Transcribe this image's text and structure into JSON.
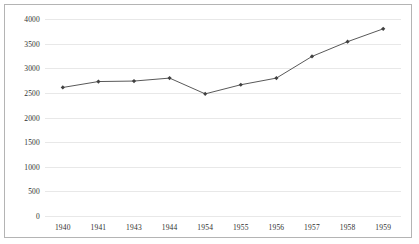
{
  "chart_data": {
    "type": "line",
    "title": "",
    "xlabel": "",
    "ylabel": "",
    "categories": [
      "1940",
      "1941",
      "1943",
      "1944",
      "1954",
      "1955",
      "1956",
      "1957",
      "1958",
      "1959"
    ],
    "values": [
      2610,
      2730,
      2740,
      2800,
      2480,
      2665,
      2800,
      3240,
      3540,
      3800
    ],
    "series": [
      {
        "name": "",
        "values": [
          2610,
          2730,
          2740,
          2800,
          2480,
          2665,
          2800,
          3240,
          3540,
          3800
        ]
      }
    ],
    "ylim": [
      0,
      4000
    ],
    "yticks": [
      0,
      500,
      1000,
      1500,
      2000,
      2500,
      3000,
      3500,
      4000
    ],
    "ytick_labels": [
      "0",
      "500",
      "1000",
      "1500",
      "2000",
      "2500",
      "3000",
      "3500",
      "4000"
    ],
    "grid": true,
    "legend": "none",
    "line_color": "#595959",
    "marker_color": "#404040",
    "marker": "diamond",
    "gridline_color": "#e8e8e8",
    "border_color": "#b4b4b4",
    "background_color": "#ffffff"
  },
  "clipped_header_text": ""
}
